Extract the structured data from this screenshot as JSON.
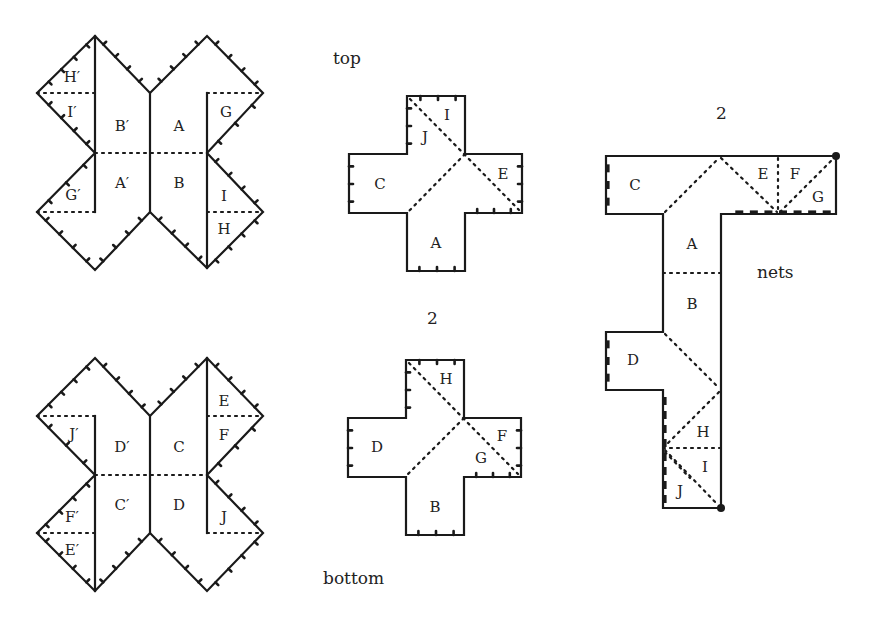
{
  "figure": {
    "captions": {
      "top": "top",
      "bottom": "bottom",
      "count_top_cross": "2",
      "count_t_net": "2",
      "nets": "nets"
    },
    "colors": {
      "ink": "#1a1a1a",
      "background": "#ffffff"
    },
    "star_shape_top": {
      "labels": [
        {
          "text": "H′",
          "x": 72,
          "y": 78
        },
        {
          "text": "I′",
          "x": 72,
          "y": 113
        },
        {
          "text": "B′",
          "x": 122,
          "y": 127
        },
        {
          "text": "A",
          "x": 179,
          "y": 127
        },
        {
          "text": "G",
          "x": 226,
          "y": 113
        },
        {
          "text": "G′",
          "x": 73,
          "y": 196
        },
        {
          "text": "A′",
          "x": 122,
          "y": 184
        },
        {
          "text": "B",
          "x": 179,
          "y": 184
        },
        {
          "text": "I",
          "x": 224,
          "y": 197
        },
        {
          "text": "H",
          "x": 224,
          "y": 230
        }
      ]
    },
    "star_shape_bottom": {
      "labels": [
        {
          "text": "E",
          "x": 224,
          "y": 402
        },
        {
          "text": "J′",
          "x": 74,
          "y": 435
        },
        {
          "text": "D′",
          "x": 122,
          "y": 448
        },
        {
          "text": "C",
          "x": 179,
          "y": 448
        },
        {
          "text": "F",
          "x": 224,
          "y": 436
        },
        {
          "text": "C′",
          "x": 122,
          "y": 506
        },
        {
          "text": "D",
          "x": 179,
          "y": 506
        },
        {
          "text": "F′",
          "x": 72,
          "y": 518
        },
        {
          "text": "E′",
          "x": 72,
          "y": 551
        },
        {
          "text": "J",
          "x": 224,
          "y": 518
        }
      ]
    },
    "cross_top": {
      "labels": [
        {
          "text": "I",
          "x": 447,
          "y": 116
        },
        {
          "text": "J",
          "x": 425,
          "y": 138
        },
        {
          "text": "C",
          "x": 380,
          "y": 185
        },
        {
          "text": "E",
          "x": 503,
          "y": 175
        },
        {
          "text": "A",
          "x": 436,
          "y": 244
        }
      ]
    },
    "cross_bottom": {
      "labels": [
        {
          "text": "H",
          "x": 446,
          "y": 380
        },
        {
          "text": "D",
          "x": 377,
          "y": 448
        },
        {
          "text": "F",
          "x": 502,
          "y": 437
        },
        {
          "text": "G",
          "x": 481,
          "y": 459
        },
        {
          "text": "B",
          "x": 435,
          "y": 508
        }
      ]
    },
    "t_net": {
      "labels": [
        {
          "text": "C",
          "x": 635,
          "y": 186
        },
        {
          "text": "E",
          "x": 763,
          "y": 175
        },
        {
          "text": "F",
          "x": 795,
          "y": 175
        },
        {
          "text": "G",
          "x": 818,
          "y": 198
        },
        {
          "text": "A",
          "x": 692,
          "y": 245
        },
        {
          "text": "B",
          "x": 692,
          "y": 305
        },
        {
          "text": "D",
          "x": 633,
          "y": 361
        },
        {
          "text": "H",
          "x": 703,
          "y": 433
        },
        {
          "text": "I",
          "x": 705,
          "y": 468
        },
        {
          "text": "J",
          "x": 680,
          "y": 492
        }
      ]
    }
  }
}
